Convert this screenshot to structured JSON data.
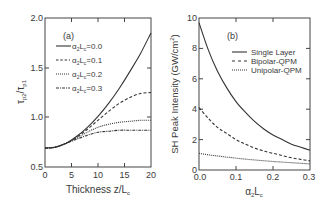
{
  "chart_data": [
    {
      "type": "line",
      "panel_label": "(a)",
      "title": "",
      "xlabel": "Thickness  z/L_c",
      "ylabel": "τ_p2/τ_p1",
      "xlim": [
        0,
        20
      ],
      "ylim": [
        0.5,
        2.0
      ],
      "xticks": [
        "0",
        "5",
        "10",
        "15",
        "20"
      ],
      "yticks": [
        "0.5",
        "1.0",
        "1.5",
        "2.0"
      ],
      "grid": false,
      "legend_position": "upper left",
      "x": [
        0,
        2,
        4,
        6,
        8,
        10,
        12,
        14,
        16,
        18,
        20
      ],
      "series": [
        {
          "name": "α2Lc=0.0",
          "style": "solid",
          "values": [
            0.69,
            0.7,
            0.74,
            0.81,
            0.9,
            1.01,
            1.14,
            1.29,
            1.46,
            1.64,
            1.85
          ]
        },
        {
          "name": "α2Lc=0.1",
          "style": "dashed",
          "values": [
            0.69,
            0.7,
            0.74,
            0.8,
            0.88,
            0.97,
            1.06,
            1.14,
            1.2,
            1.24,
            1.25
          ]
        },
        {
          "name": "α2Lc=0.2",
          "style": "dotted",
          "values": [
            0.69,
            0.7,
            0.74,
            0.79,
            0.85,
            0.9,
            0.93,
            0.95,
            0.96,
            0.97,
            0.97
          ]
        },
        {
          "name": "α2Lc=0.3",
          "style": "dashdot",
          "values": [
            0.69,
            0.7,
            0.74,
            0.78,
            0.82,
            0.85,
            0.86,
            0.87,
            0.87,
            0.87,
            0.87
          ]
        }
      ]
    },
    {
      "type": "line",
      "panel_label": "(b)",
      "title": "",
      "xlabel": "α2Lc",
      "ylabel": "SH  Peak  Intensity  (GW/cm²)",
      "xlim": [
        0,
        0.3
      ],
      "ylim": [
        0,
        10
      ],
      "xticks": [
        "0.0",
        "0.1",
        "0.2",
        "0.3"
      ],
      "yticks": [
        "0",
        "2",
        "4",
        "6",
        "8",
        "10"
      ],
      "grid": false,
      "legend_position": "upper right",
      "x": [
        0,
        0.025,
        0.05,
        0.075,
        0.1,
        0.125,
        0.15,
        0.175,
        0.2,
        0.225,
        0.25,
        0.275,
        0.3
      ],
      "series": [
        {
          "name": "Single Layer",
          "style": "solid",
          "values": [
            9.7,
            7.9,
            6.5,
            5.4,
            4.5,
            3.8,
            3.2,
            2.7,
            2.3,
            2.0,
            1.7,
            1.5,
            1.3
          ]
        },
        {
          "name": "Bipolar-QPM",
          "style": "dashed",
          "values": [
            4.1,
            3.4,
            2.8,
            2.4,
            2.0,
            1.7,
            1.45,
            1.25,
            1.1,
            0.95,
            0.8,
            0.7,
            0.6
          ]
        },
        {
          "name": "Unipolar-QPM",
          "style": "dotted",
          "values": [
            1.1,
            1.0,
            0.92,
            0.85,
            0.78,
            0.72,
            0.66,
            0.61,
            0.56,
            0.52,
            0.48,
            0.44,
            0.4
          ]
        }
      ]
    }
  ],
  "panel_a": {
    "label": "(a)",
    "xlabel": "Thickness  z/L",
    "xlabel_sub": "c",
    "ylabel_tau1": "τ",
    "ylabel_sub1": "p2",
    "ylabel_slash": "/τ",
    "ylabel_sub2": "p1",
    "xticks": [
      "0",
      "5",
      "10",
      "15",
      "20"
    ],
    "yticks": [
      "0.5",
      "1.0",
      "1.5",
      "2.0"
    ],
    "legend": [
      {
        "pre": "α",
        "s1": "2",
        "mid": "L",
        "s2": "c",
        "post": "=0.0"
      },
      {
        "pre": "α",
        "s1": "2",
        "mid": "L",
        "s2": "c",
        "post": "=0.1"
      },
      {
        "pre": "α",
        "s1": "2",
        "mid": "L",
        "s2": "c",
        "post": "=0.2"
      },
      {
        "pre": "α",
        "s1": "2",
        "mid": "L",
        "s2": "c",
        "post": "=0.3"
      }
    ]
  },
  "panel_b": {
    "label": "(b)",
    "xlabel_pre": "α",
    "xlabel_s1": "2",
    "xlabel_mid": "L",
    "xlabel_s2": "c",
    "ylabel": "SH  Peak  Intensity  (GW/cm",
    "ylabel_sup": "2",
    "ylabel_end": ")",
    "xticks": [
      "0.0",
      "0.1",
      "0.2",
      "0.3"
    ],
    "yticks": [
      "0",
      "2",
      "4",
      "6",
      "8",
      "10"
    ],
    "legend": [
      "Single Layer",
      "Bipolar-QPM",
      "Unipolar-QPM"
    ]
  }
}
